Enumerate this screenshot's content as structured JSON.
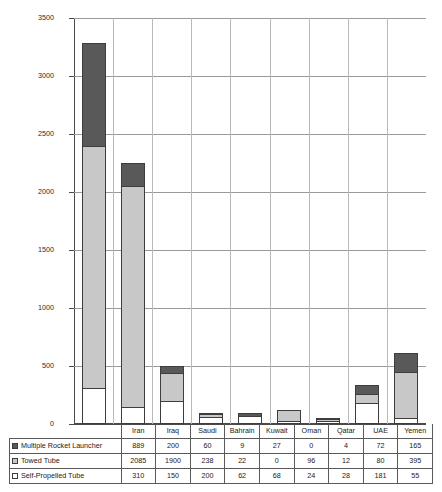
{
  "chart_data": {
    "type": "bar",
    "title": "",
    "xlabel": "",
    "ylabel": "",
    "ylim": [
      0,
      3500
    ],
    "ytick_step": 500,
    "yticks": [
      "3500",
      "3000",
      "2500",
      "2000",
      "1500",
      "1000",
      "500",
      "0"
    ],
    "grid": true,
    "stacked": true,
    "legend_position": "table-row-headers",
    "categories": [
      "Iran",
      "Iraq",
      "Saudi",
      "Bahrain",
      "Kuwait",
      "Oman",
      "Qatar",
      "UAE",
      "Yemen"
    ],
    "series": [
      {
        "name": "Multiple Rocket Launcher",
        "color": "#595959",
        "values": [
          889,
          200,
          60,
          9,
          27,
          0,
          4,
          72,
          165
        ]
      },
      {
        "name": "Towed Tube",
        "color": "#c8c8c8",
        "values": [
          2085,
          1900,
          238,
          22,
          0,
          96,
          12,
          80,
          395
        ]
      },
      {
        "name": "Self-Propelled Tube",
        "color": "#ffffff",
        "values": [
          310,
          150,
          200,
          62,
          68,
          24,
          28,
          181,
          55
        ]
      }
    ]
  },
  "table": {
    "row_labels": [
      "Multiple Rocket Launcher",
      "Towed Tube",
      "Self-Propelled Tube"
    ]
  }
}
